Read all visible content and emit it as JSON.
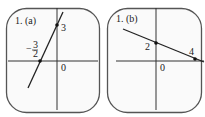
{
  "panels": [
    {
      "id": "a",
      "title": "1. (a)",
      "x_intercept_label": "-3/2",
      "x_intercept_num": "3",
      "x_intercept_den": "2",
      "y_intercept_label": "3",
      "origin_label": "0",
      "points": [
        [
          -1.5,
          0
        ],
        [
          0,
          3
        ]
      ]
    },
    {
      "id": "b",
      "title": "1. (b)",
      "y_intercept_label": "2",
      "x_intercept_label": "4",
      "origin_label": "0",
      "points": [
        [
          0,
          2
        ],
        [
          4,
          0
        ]
      ]
    }
  ],
  "colors": {
    "line": "#222222",
    "axis": "#333333",
    "border": "#555555"
  }
}
